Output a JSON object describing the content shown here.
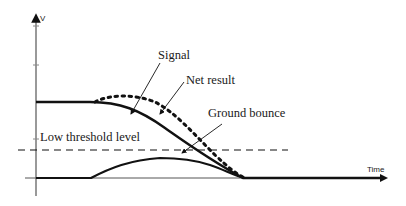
{
  "diagram": {
    "axes": {
      "y_label": "V",
      "x_label": "Time"
    },
    "labels": {
      "signal": "Signal",
      "net_result": "Net result",
      "ground_bounce": "Ground bounce",
      "threshold": "Low threshold level"
    },
    "colors": {
      "line": "#111111",
      "axis": "#555555",
      "background": "#ffffff"
    }
  }
}
